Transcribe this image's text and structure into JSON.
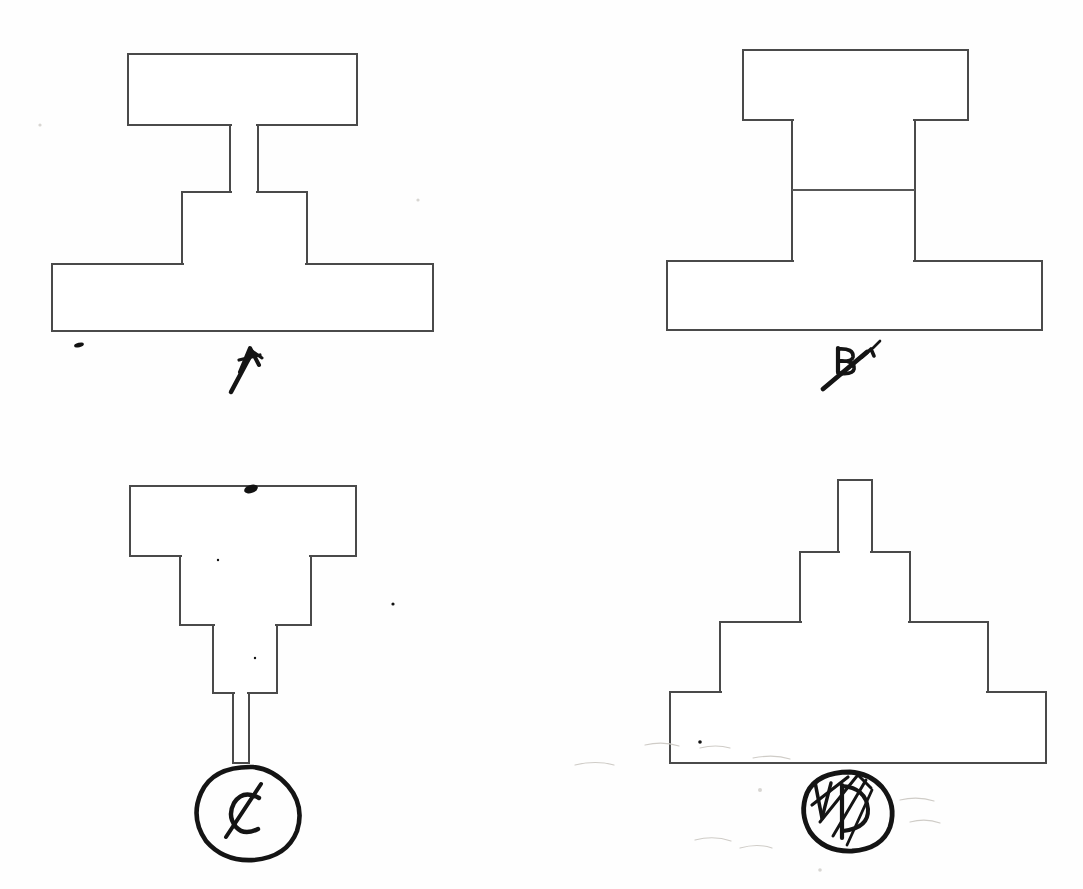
{
  "sheet": {
    "width": 1083,
    "height": 889,
    "background_color": "#fefefe",
    "line_color": "#4a4a4a",
    "ink_color": "#141414",
    "description": "Hand-drawn engineering sketch sheet with four stacked-block elevation figures labelled A, B, C and D in pen"
  },
  "figures": [
    {
      "id": "figure-a",
      "label": "A",
      "label_style": "handwritten-pen-with-tail",
      "label_circled": false,
      "label_x": 246,
      "label_y": 368,
      "description": "Top plate on a narrow post, short mid block, wide base plate",
      "parts": [
        {
          "name": "top-plate",
          "x": 128,
          "y": 54,
          "w": 229,
          "h": 71
        },
        {
          "name": "narrow-post",
          "x": 230,
          "y": 125,
          "w": 28,
          "h": 67
        },
        {
          "name": "mid-block",
          "x": 182,
          "y": 192,
          "w": 125,
          "h": 72
        },
        {
          "name": "base-plate",
          "x": 52,
          "y": 264,
          "w": 381,
          "h": 67
        }
      ]
    },
    {
      "id": "figure-b",
      "label": "B",
      "label_style": "handwritten-pen-struck-through",
      "label_circled": false,
      "label_x": 845,
      "label_y": 368,
      "description": "Top plate over a wide two-segment column seated on a wide base plate",
      "parts": [
        {
          "name": "top-plate",
          "x": 743,
          "y": 50,
          "w": 225,
          "h": 70
        },
        {
          "name": "column-upper",
          "x": 792,
          "y": 120,
          "w": 123,
          "h": 70
        },
        {
          "name": "column-lower",
          "x": 792,
          "y": 190,
          "w": 123,
          "h": 71
        },
        {
          "name": "base-plate",
          "x": 667,
          "y": 261,
          "w": 375,
          "h": 69
        }
      ]
    },
    {
      "id": "figure-c",
      "label": "C",
      "label_style": "handwritten-pen-circled",
      "label_circled": true,
      "label_x": 250,
      "label_y": 812,
      "description": "Inverted stepped pyramid: widest plate on top narrowing down to a thin stem",
      "parts": [
        {
          "name": "top-plate",
          "x": 130,
          "y": 486,
          "w": 226,
          "h": 70
        },
        {
          "name": "second-block",
          "x": 180,
          "y": 556,
          "w": 131,
          "h": 69
        },
        {
          "name": "third-block",
          "x": 213,
          "y": 625,
          "w": 64,
          "h": 68
        },
        {
          "name": "thin-stem",
          "x": 233,
          "y": 693,
          "w": 16,
          "h": 70
        }
      ]
    },
    {
      "id": "figure-d",
      "label": "D",
      "label_style": "handwritten-pen-circled-scribbled",
      "label_circled": true,
      "label_x": 850,
      "label_y": 812,
      "description": "Upright stepped pyramid: thin stem on top widening down to a broad base plate",
      "parts": [
        {
          "name": "thin-stem",
          "x": 838,
          "y": 480,
          "w": 34,
          "h": 72
        },
        {
          "name": "second-block",
          "x": 800,
          "y": 552,
          "w": 110,
          "h": 70
        },
        {
          "name": "third-block",
          "x": 720,
          "y": 622,
          "w": 268,
          "h": 70
        },
        {
          "name": "base-plate",
          "x": 670,
          "y": 692,
          "w": 376,
          "h": 71
        }
      ]
    }
  ],
  "marks": [
    {
      "name": "ink-dot-below-figure-a-base",
      "x": 76,
      "y": 345,
      "w": 9,
      "h": 4
    },
    {
      "name": "ink-blot-on-figure-c-top-edge",
      "x": 250,
      "y": 487,
      "w": 14,
      "h": 8
    },
    {
      "name": "tick-mark-above-figure-b-label",
      "x": 872,
      "y": 350
    },
    {
      "name": "faint-dot-right-of-figure-c",
      "x": 393,
      "y": 604
    },
    {
      "name": "faint-dot-left-of-figure-d-label",
      "x": 700,
      "y": 740
    },
    {
      "name": "pencil-smudge-under-figure-d-base",
      "x": 740,
      "y": 760
    },
    {
      "name": "pencil-smudge-bottom-left-of-figure-d",
      "x": 690,
      "y": 840
    }
  ]
}
